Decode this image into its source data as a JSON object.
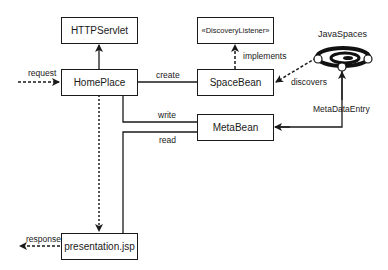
{
  "diagram": {
    "nodes": {
      "httpservlet": "HTTPServlet",
      "homeplace": "HomePlace",
      "discoverylistener": "«DiscoveryListener»",
      "spacebean": "SpaceBean",
      "metabean": "MetaBean",
      "presentation": "presentation.jsp",
      "javaspaces": "JavaSpaces"
    },
    "edges": {
      "request": "request",
      "create": "create",
      "implements": "implements",
      "discovers": "discovers",
      "metadataentry": "MetaDataEntry",
      "write": "write",
      "read": "read",
      "response": "response"
    },
    "javaspaces_icon": "javaspaces-orbit-icon",
    "colors": {
      "stroke": "#1a1a1a",
      "background": "#ffffff"
    }
  }
}
